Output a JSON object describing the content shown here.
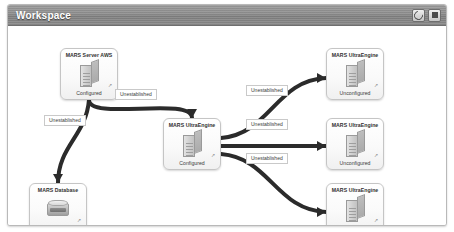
{
  "window": {
    "title": "Workspace",
    "buttons": [
      {
        "name": "refresh-button",
        "icon": "refresh-icon",
        "label": ""
      },
      {
        "name": "stop-button",
        "icon": "square-icon",
        "label": ""
      }
    ]
  },
  "colors": {
    "titlebar_bg": "#8d8d8d",
    "title_text": "#ffffff",
    "panel_border": "#b9b9b9",
    "canvas_bg": "#ffffff",
    "node_border": "#c5c5c5",
    "edge_stroke": "#2b2b2b",
    "label_border": "#c9c9c9"
  },
  "diagram": {
    "nodes": [
      {
        "id": "server-aws",
        "title": "MARS Server AWS",
        "status": "Configured",
        "icon": "server-icon",
        "badge": "↗",
        "x": 52,
        "y": 22,
        "w": 58,
        "h": 52
      },
      {
        "id": "ultra-center",
        "title": "MARS UltraEngine",
        "status": "Configured",
        "icon": "server-icon",
        "badge": "↗",
        "x": 155,
        "y": 92,
        "w": 58,
        "h": 52
      },
      {
        "id": "database",
        "title": "MARS Database",
        "status": "Configured",
        "icon": "database-icon",
        "badge": "↗",
        "x": 21,
        "y": 157,
        "w": 58,
        "h": 52
      },
      {
        "id": "ultra-top",
        "title": "MARS UltraEngine",
        "status": "Unconfigured",
        "icon": "server-icon",
        "badge": "↗",
        "x": 318,
        "y": 22,
        "w": 58,
        "h": 52
      },
      {
        "id": "ultra-mid",
        "title": "MARS UltraEngine",
        "status": "Unconfigured",
        "icon": "server-icon",
        "badge": "↗",
        "x": 318,
        "y": 92,
        "w": 58,
        "h": 52
      },
      {
        "id": "ultra-bot",
        "title": "MARS UltraEngine",
        "status": "Unconfigured",
        "icon": "server-icon",
        "badge": "↗",
        "x": 318,
        "y": 157,
        "w": 58,
        "h": 52
      }
    ],
    "edges": [
      {
        "id": "e1",
        "from": "server-aws",
        "to": "ultra-center",
        "label": "Unestablished",
        "lx": 107,
        "ly": 84
      },
      {
        "id": "e2",
        "from": "server-aws",
        "to": "database",
        "label": "Unestablished",
        "lx": 36,
        "ly": 110
      },
      {
        "id": "e3",
        "from": "ultra-center",
        "to": "ultra-top",
        "label": "Unestablished",
        "lx": 238,
        "ly": 80
      },
      {
        "id": "e4",
        "from": "ultra-center",
        "to": "ultra-mid",
        "label": "Unestablished",
        "lx": 238,
        "ly": 114
      },
      {
        "id": "e5",
        "from": "ultra-center",
        "to": "ultra-bot",
        "label": "Unestablished",
        "lx": 238,
        "ly": 148
      }
    ]
  }
}
